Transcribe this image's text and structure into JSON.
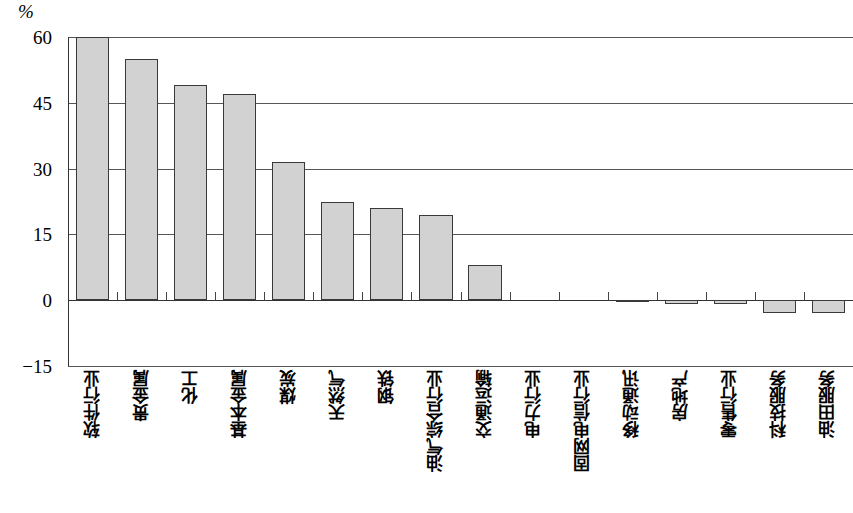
{
  "chart_data": {
    "type": "bar",
    "title": "",
    "subtitle": "",
    "xlabel": "",
    "ylabel": "%",
    "unit_label": "%",
    "ylim": [
      -15,
      60
    ],
    "yticks": [
      60,
      45,
      30,
      15,
      0,
      -15
    ],
    "ytick_labels": [
      "60",
      "45",
      "30",
      "15",
      "0",
      "−15"
    ],
    "grid": true,
    "legend": null,
    "categories": [
      "软件行业",
      "贵金属",
      "化工",
      "基本金属",
      "煤炭",
      "天然气",
      "钢铁",
      "油气综合行业",
      "交通运输",
      "电力行业",
      "固网电信行业",
      "移动通讯",
      "房地产",
      "零售行业",
      "科技服务",
      "油田服务"
    ],
    "values": [
      60,
      55,
      49,
      47,
      31.5,
      22.5,
      21,
      19.5,
      8,
      0,
      0,
      -0.3,
      -0.8,
      -0.9,
      -3,
      -3
    ],
    "colors": {
      "bar_fill": "#d2d2d2",
      "bar_stroke": "#3a3a3a",
      "gridline": "#555555",
      "axis": "#333333",
      "background": "#ffffff",
      "text": "#000000"
    }
  }
}
